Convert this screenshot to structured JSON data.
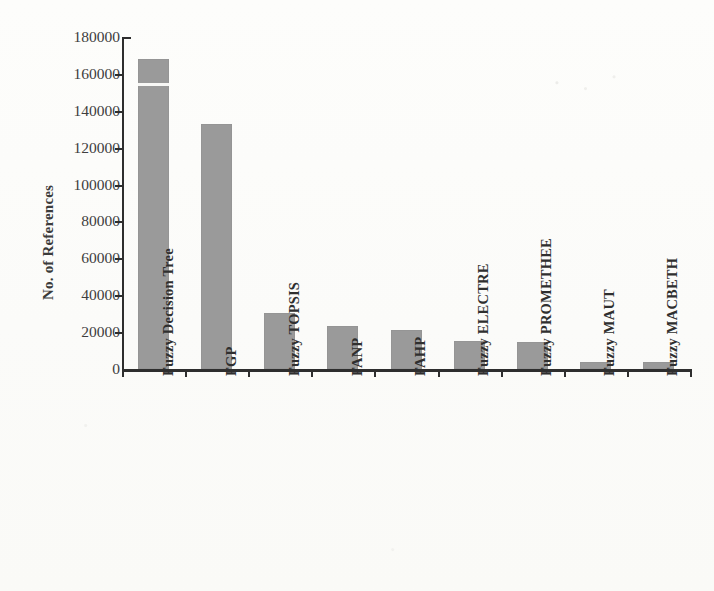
{
  "chart_data": {
    "type": "bar",
    "title": "",
    "subtitle": "",
    "xlabel": "",
    "ylabel": "No. of References",
    "categories": [
      "Fuzzy Decision Tree",
      "FGP",
      "Fuzzy TOPSIS",
      "FANP",
      "FAHP",
      "Fuzzy ELECTRE",
      "Fuzzy PROMETHEE",
      "Fuzzy MAUT",
      "Fuzzy MACBETH"
    ],
    "values": [
      168000,
      133000,
      30500,
      23500,
      21000,
      15000,
      14500,
      4000,
      4000
    ],
    "ylim": [
      0,
      180000
    ],
    "ytick_values": [
      0,
      20000,
      40000,
      60000,
      80000,
      100000,
      120000,
      140000,
      160000,
      180000
    ],
    "ytick_labels": [
      "0",
      "20000",
      "40000",
      "60000",
      "80000",
      "100000",
      "120000",
      "140000",
      "160000",
      "180000"
    ],
    "grid": false,
    "legend": false,
    "legend_position": "none",
    "bar_color": "#9a9a9a",
    "axis_color": "#2e2e2e",
    "background_color": "#fdfdfb",
    "orientation": "vertical",
    "x_tick_label_rotation": 90,
    "annotations": [
      {
        "name": "scan-artifact-line",
        "description": "thin white horizontal scan line across first bar",
        "category": "Fuzzy Decision Tree",
        "at_value": 155000
      }
    ]
  }
}
